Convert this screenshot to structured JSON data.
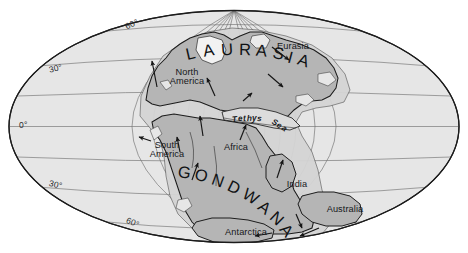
{
  "figure": {
    "projection": "Mollweide (oval equal-area)",
    "canvas": {
      "width": 468,
      "height": 253
    },
    "colors": {
      "ocean": "#e6e6e6",
      "landmass": "#b4b4b4",
      "shelf": "#d2d2d2",
      "outline": "#232323",
      "graticule": "#6d6d6d",
      "text": "#16181a",
      "background": "#ffffff"
    }
  },
  "graticule": {
    "latitude_labels": [
      {
        "id": "lat-60-north",
        "text": "60°",
        "x": 124,
        "y": 23,
        "rotate": -24
      },
      {
        "id": "lat-30-north",
        "text": "30°",
        "x": 48,
        "y": 66,
        "rotate": -14
      },
      {
        "id": "lat-0-equator",
        "text": "0°",
        "x": 19,
        "y": 121,
        "rotate": 0
      },
      {
        "id": "lat-30-south",
        "text": "30°",
        "x": 50,
        "y": 179,
        "rotate": 13
      },
      {
        "id": "lat-60-south",
        "text": "60°",
        "x": 128,
        "y": 216,
        "rotate": 22
      }
    ],
    "meridian_count": 13,
    "parallel_values": [
      75,
      60,
      45,
      30,
      15,
      0,
      -15,
      -30,
      -45,
      -60,
      -75
    ]
  },
  "supercontinents": [
    {
      "id": "laurasia",
      "name": "LAURASIA",
      "letters": [
        {
          "ch": "L",
          "x": 186,
          "y": 44,
          "rot": -13
        },
        {
          "ch": "A",
          "x": 203,
          "y": 41,
          "rot": -9
        },
        {
          "ch": "U",
          "x": 221,
          "y": 40,
          "rot": -4
        },
        {
          "ch": "R",
          "x": 239,
          "y": 40,
          "rot": 1
        },
        {
          "ch": "A",
          "x": 256,
          "y": 41,
          "rot": 6
        },
        {
          "ch": "S",
          "x": 273,
          "y": 44,
          "rot": 11
        },
        {
          "ch": "I",
          "x": 288,
          "y": 48,
          "rot": 15
        },
        {
          "ch": "A",
          "x": 298,
          "y": 51,
          "rot": 19
        }
      ]
    },
    {
      "id": "gondwana",
      "name": "GONDWANA",
      "letters": [
        {
          "ch": "G",
          "x": 178,
          "y": 163,
          "rot": 8
        },
        {
          "ch": "O",
          "x": 195,
          "y": 166,
          "rot": 14
        },
        {
          "ch": "N",
          "x": 212,
          "y": 171,
          "rot": 20
        },
        {
          "ch": "D",
          "x": 228,
          "y": 178,
          "rot": 26
        },
        {
          "ch": "W",
          "x": 243,
          "y": 187,
          "rot": 32
        },
        {
          "ch": "A",
          "x": 259,
          "y": 198,
          "rot": 38
        },
        {
          "ch": "N",
          "x": 271,
          "y": 209,
          "rot": 44
        },
        {
          "ch": "A",
          "x": 281,
          "y": 221,
          "rot": 50
        }
      ]
    }
  ],
  "ocean_labels": [
    {
      "id": "tethys-sea",
      "name": "Tethys Sea",
      "letters": [
        {
          "ch": "T",
          "x": 232,
          "y": 115,
          "rot": -6
        },
        {
          "ch": "e",
          "x": 238,
          "y": 114,
          "rot": -6
        },
        {
          "ch": "t",
          "x": 243,
          "y": 114,
          "rot": -4
        },
        {
          "ch": "h",
          "x": 247,
          "y": 114,
          "rot": -2
        },
        {
          "ch": "y",
          "x": 252,
          "y": 114,
          "rot": 0
        },
        {
          "ch": "s",
          "x": 257,
          "y": 114,
          "rot": 2
        },
        {
          "ch": "S",
          "x": 272,
          "y": 118,
          "rot": 26
        },
        {
          "ch": "e",
          "x": 277,
          "y": 121,
          "rot": 30
        },
        {
          "ch": "a",
          "x": 282,
          "y": 124,
          "rot": 34
        }
      ]
    }
  ],
  "continent_labels": [
    {
      "id": "north-america",
      "line1": "North",
      "line2": "America",
      "x": 164,
      "y": 68,
      "width": 46
    },
    {
      "id": "eurasia",
      "line1": "Eurasia",
      "line2": "",
      "x": 270,
      "y": 42,
      "width": 46
    },
    {
      "id": "south-america",
      "line1": "South",
      "line2": "America",
      "x": 143,
      "y": 141,
      "width": 48
    },
    {
      "id": "africa",
      "line1": "Africa",
      "line2": "",
      "x": 216,
      "y": 143,
      "width": 40
    },
    {
      "id": "india",
      "line1": "India",
      "line2": "",
      "x": 281,
      "y": 180,
      "width": 32
    },
    {
      "id": "australia",
      "line1": "Australia",
      "line2": "",
      "x": 320,
      "y": 205,
      "width": 50
    },
    {
      "id": "antarctica",
      "line1": "Antarctica",
      "line2": "",
      "x": 218,
      "y": 228,
      "width": 56
    }
  ],
  "motion_arrows": [
    {
      "id": "arrow-north-america",
      "x1": 157,
      "y1": 87,
      "x2": 152,
      "y2": 61
    },
    {
      "id": "arrow-eurasia-east",
      "x1": 272,
      "y1": 47,
      "x2": 289,
      "y2": 60
    },
    {
      "id": "arrow-eurasia-southeast",
      "x1": 268,
      "y1": 74,
      "x2": 283,
      "y2": 87
    },
    {
      "id": "arrow-greenland",
      "x1": 215,
      "y1": 96,
      "x2": 207,
      "y2": 78
    },
    {
      "id": "arrow-tethys-north",
      "x1": 243,
      "y1": 101,
      "x2": 252,
      "y2": 93
    },
    {
      "id": "arrow-south-america",
      "x1": 151,
      "y1": 141,
      "x2": 139,
      "y2": 137
    },
    {
      "id": "arrow-south-america-up",
      "x1": 180,
      "y1": 152,
      "x2": 177,
      "y2": 137
    },
    {
      "id": "arrow-africa-north",
      "x1": 203,
      "y1": 136,
      "x2": 200,
      "y2": 116
    },
    {
      "id": "arrow-gondwana-up",
      "x1": 192,
      "y1": 180,
      "x2": 198,
      "y2": 163
    },
    {
      "id": "arrow-india-north",
      "x1": 277,
      "y1": 178,
      "x2": 283,
      "y2": 160
    },
    {
      "id": "arrow-tethys-south",
      "x1": 240,
      "y1": 140,
      "x2": 246,
      "y2": 125
    },
    {
      "id": "arrow-australia-sw",
      "x1": 319,
      "y1": 228,
      "x2": 300,
      "y2": 236
    },
    {
      "id": "arrow-antarctica-west",
      "x1": 272,
      "y1": 233,
      "x2": 255,
      "y2": 236
    },
    {
      "id": "arrow-antarctica-east",
      "x1": 296,
      "y1": 214,
      "x2": 302,
      "y2": 228
    }
  ]
}
